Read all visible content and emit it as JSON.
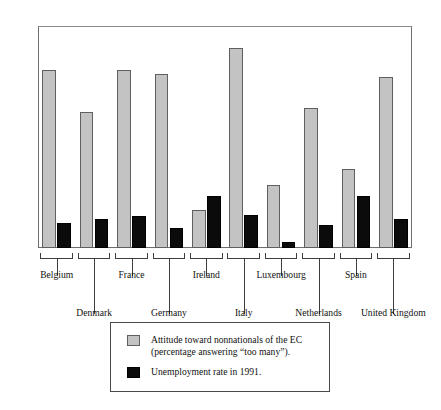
{
  "chart_data": {
    "type": "bar",
    "title": "",
    "xlabel": "",
    "ylabel": "",
    "ylim": [
      0,
      70
    ],
    "yticks": [
      0,
      10,
      20,
      30,
      40,
      50,
      60,
      70
    ],
    "grid": false,
    "legend_position": "bottom",
    "categories": [
      "Belgium",
      "Denmark",
      "France",
      "Germany",
      "Ireland",
      "Italy",
      "Luxembourg",
      "Netherlands",
      "Spain",
      "United Kingdom"
    ],
    "series": [
      {
        "name": "Attitude toward nonnationals of the EC\n(percentage answering “too many”).",
        "color": "#c3c3c3",
        "values": [
          56,
          43,
          56,
          55,
          12,
          63,
          20,
          44,
          25,
          54
        ]
      },
      {
        "name": "Unemployment rate in 1991.",
        "color": "#0b0b0b",
        "values": [
          8,
          9.3,
          10,
          6.3,
          16.3,
          10.5,
          2,
          7.2,
          16.3,
          9
        ]
      }
    ]
  },
  "axis": {
    "tick_labels": [
      "70",
      "60",
      "50",
      "40",
      "30",
      "20",
      "10",
      "0"
    ]
  },
  "legend": {
    "items": [
      {
        "swatch": "grey",
        "label": "Attitude toward nonnationals of the EC\n(percentage answering “too many”)."
      },
      {
        "swatch": "black",
        "label": "Unemployment rate in 1991."
      }
    ]
  }
}
